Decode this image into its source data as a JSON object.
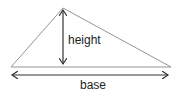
{
  "diagram": {
    "type": "triangle-area",
    "labels": {
      "height": "height",
      "base": "base"
    },
    "colors": {
      "triangle_stroke": "#888888",
      "arrow_stroke": "#333333",
      "text": "#222222"
    }
  }
}
